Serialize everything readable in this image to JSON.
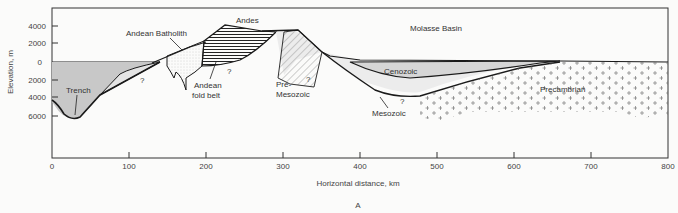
{
  "figure": {
    "panel_label": "A",
    "x_axis": {
      "label": "Horizontal distance, km",
      "ticks": [
        "0",
        "100",
        "200",
        "300",
        "400",
        "500",
        "600",
        "700",
        "800"
      ]
    },
    "y_axis": {
      "label": "Elevation, m",
      "ticks_above": [
        "4000",
        "2000"
      ],
      "tick_zero": "0",
      "ticks_below": [
        "2000",
        "4000",
        "6000"
      ]
    },
    "regions": {
      "andes": "Andes",
      "molasse_basin": "Molasse Basin",
      "andean_batholith": "Andean Batholith",
      "trench": "Trench",
      "andean_fold_belt_line1": "Andean",
      "andean_fold_belt_line2": "fold belt",
      "pre_mesozoic_line1": "Pre-",
      "pre_mesozoic_line2": "Mesozoic",
      "cenozoic": "Cenozoic",
      "mesozoic": "Mesozoic",
      "precambrian": "Precambrian"
    },
    "uncertainty_marks": [
      "?",
      "?",
      "?",
      "?"
    ],
    "colors": {
      "ocean_fill": "#c8c8c8",
      "sediment_fill": "#e2e2e2",
      "line": "#1a1a1a",
      "background": "#fbfbfa"
    }
  }
}
